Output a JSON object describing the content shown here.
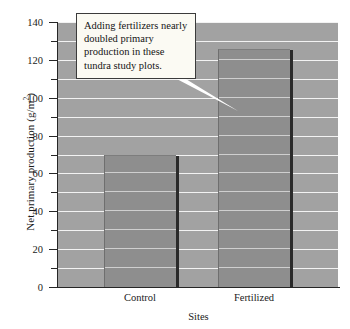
{
  "chart_data": {
    "type": "bar",
    "title": "",
    "categories": [
      "Control",
      "Fertilized"
    ],
    "values": [
      70,
      126
    ],
    "xlabel": "Sites",
    "ylabel": "Net primary production (g/m²)",
    "ylabel_main": "Net primary production (g/m",
    "ylabel_exponent": "2",
    "ylabel_close": ")",
    "ylim": [
      0,
      140
    ],
    "ytick_labels": [
      "0",
      "20",
      "40",
      "60",
      "80",
      "100",
      "120",
      "140"
    ],
    "ytick_values": [
      0,
      20,
      40,
      60,
      80,
      100,
      120,
      140
    ],
    "yminor_values": [
      10,
      30,
      50,
      70,
      90,
      110,
      130
    ],
    "gridline_values": [
      10,
      20,
      30,
      40,
      50,
      60,
      70,
      80,
      90,
      100,
      110,
      120,
      130,
      140
    ],
    "grid": true,
    "legend": "none",
    "annotation": "Adding fertilizers nearly doubled primary production in these tundra study plots.",
    "colors": {
      "plot_background": "#a2a2a2",
      "bar_fill": "#8e8e8e",
      "bar_shadow": "#2a2a2a",
      "gridline": "#f2f2f2",
      "axis": "#262626",
      "callout_background": "#fbfaf3",
      "callout_border": "#3b3b3b",
      "text": "#1a1a1a",
      "leader_line": "#ffffff"
    }
  }
}
